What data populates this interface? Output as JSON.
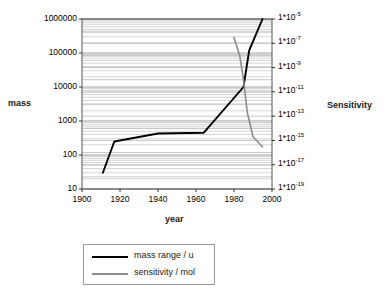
{
  "chart_data": {
    "type": "line",
    "title": "",
    "xlabel": "year",
    "ylabel": "mass",
    "y2label": "Sensitivity",
    "grid": true,
    "legend_position": "bottom",
    "xlim": [
      1900,
      2000
    ],
    "xticks": [
      1900,
      1920,
      1940,
      1960,
      1980,
      2000
    ],
    "xtick_labels": [
      "1900",
      "1920",
      "1940",
      "1960",
      "1980",
      "2000"
    ],
    "yscale": "log",
    "ylim": [
      10,
      1000000
    ],
    "yticks": [
      10,
      100,
      1000,
      10000,
      100000,
      1000000
    ],
    "ytick_labels": [
      "10",
      "100",
      "1000",
      "10000",
      "100000",
      "1000000"
    ],
    "y2scale": "log",
    "y2lim": [
      1e-19,
      1e-05
    ],
    "y2ticks": [
      1e-19,
      1e-17,
      1e-15,
      1e-13,
      1e-11,
      1e-09,
      1e-07,
      1e-05
    ],
    "y2tick_labels": [
      {
        "mantissa": "1*10",
        "exponent": "-19"
      },
      {
        "mantissa": "1*10",
        "exponent": "-17"
      },
      {
        "mantissa": "1*10",
        "exponent": "-15"
      },
      {
        "mantissa": "1*10",
        "exponent": "-13"
      },
      {
        "mantissa": "1*10",
        "exponent": "-11"
      },
      {
        "mantissa": "1*10",
        "exponent": "-9"
      },
      {
        "mantissa": "1*10",
        "exponent": "-7"
      },
      {
        "mantissa": "1*10",
        "exponent": "-5"
      }
    ],
    "series": [
      {
        "name": "mass range / u",
        "axis": "left",
        "color": "#000000",
        "x": [
          1911,
          1917,
          1940,
          1964,
          1985,
          1988,
          1995
        ],
        "y": [
          30,
          250,
          430,
          450,
          10000,
          120000,
          1000000
        ]
      },
      {
        "name": "sensitivity / mol",
        "axis": "right",
        "color": "#8c8c8c",
        "x": [
          1980,
          1983,
          1985,
          1987,
          1990,
          1995
        ],
        "y": [
          3e-07,
          1e-08,
          1e-10,
          2e-13,
          2e-15,
          3e-16
        ]
      }
    ]
  },
  "legend": {
    "items": [
      {
        "label": "mass range / u"
      },
      {
        "label": "sensitivity / mol"
      }
    ]
  }
}
